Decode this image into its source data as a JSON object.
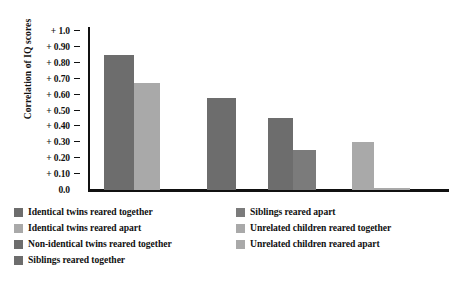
{
  "chart_data": {
    "type": "bar",
    "title": "",
    "subtitle": "",
    "xlabel": "",
    "ylabel": "Correlation of IQ scores",
    "ylim": [
      0.0,
      1.0
    ],
    "grid": false,
    "legend_position": "bottom",
    "y_ticks": [
      {
        "value": 1.0,
        "label": "+ 1.0"
      },
      {
        "value": 0.9,
        "label": "+ 0.90"
      },
      {
        "value": 0.8,
        "label": "+ 0.80"
      },
      {
        "value": 0.7,
        "label": "+ 0.70"
      },
      {
        "value": 0.6,
        "label": "+ 0.60"
      },
      {
        "value": 0.5,
        "label": "+ 0.50"
      },
      {
        "value": 0.4,
        "label": "+ 0.40"
      },
      {
        "value": 0.3,
        "label": "+ 0.30"
      },
      {
        "value": 0.2,
        "label": "+ 0.20"
      },
      {
        "value": 0.1,
        "label": "+ 0.10"
      },
      {
        "value": 0.0,
        "label": "0.0"
      }
    ],
    "categories": [
      "Identical twins reared together",
      "Identical twins reared apart",
      "Non-identical twins reared together",
      "Siblings reared together",
      "Siblings reared apart",
      "Unrelated children reared together",
      "Unrelated children reared apart"
    ],
    "values": [
      0.85,
      0.67,
      0.58,
      0.45,
      0.25,
      0.3,
      0.01
    ],
    "bars": [
      {
        "label": "Identical twins reared together",
        "value": 0.85,
        "color": "#6d6d6d",
        "x": 104,
        "width": 30
      },
      {
        "label": "Identical twins reared apart",
        "value": 0.67,
        "color": "#a9a9a9",
        "x": 134,
        "width": 26
      },
      {
        "label": "Non-identical twins reared together",
        "value": 0.58,
        "color": "#6d6d6d",
        "x": 207,
        "width": 29
      },
      {
        "label": "Siblings reared together",
        "value": 0.45,
        "color": "#6d6d6d",
        "x": 268,
        "width": 25
      },
      {
        "label": "Siblings reared apart",
        "value": 0.25,
        "color": "#7b7b7b",
        "x": 293,
        "width": 23
      },
      {
        "label": "Unrelated children reared together",
        "value": 0.3,
        "color": "#a9a9a9",
        "x": 352,
        "width": 22
      },
      {
        "label": "Unrelated children reared apart",
        "value": 0.01,
        "color": "#a9a9a9",
        "x": 374,
        "width": 36
      }
    ]
  },
  "legend": {
    "left_column": [
      {
        "label": "Identical twins reared together",
        "color": "#6d6d6d"
      },
      {
        "label": "Identical twins reared apart",
        "color": "#a9a9a9"
      },
      {
        "label": "Non-identical twins reared together",
        "color": "#6d6d6d"
      },
      {
        "label": "Siblings reared together",
        "color": "#6d6d6d"
      }
    ],
    "right_column": [
      {
        "label": "Siblings reared apart",
        "color": "#7b7b7b"
      },
      {
        "label": "Unrelated children reared together",
        "color": "#a9a9a9"
      },
      {
        "label": "Unrelated children reared apart",
        "color": "#a9a9a9"
      }
    ]
  },
  "colors": {
    "dark_bar": "#6d6d6d",
    "medium_bar": "#7b7b7b",
    "light_bar": "#a9a9a9",
    "axis": "#111111",
    "background": "#ffffff"
  }
}
